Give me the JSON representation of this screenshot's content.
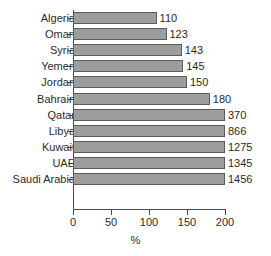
{
  "chart_data": {
    "type": "bar",
    "orientation": "horizontal",
    "title": "",
    "xlabel": "%",
    "ylabel": "",
    "xlim": [
      0,
      200
    ],
    "xticks": [
      "0",
      "50",
      "100",
      "150",
      "200"
    ],
    "grid": false,
    "legend": null,
    "note": "Bars are clipped at the axis maximum of 200; data labels show the true values.",
    "categories": [
      "Algeria",
      "Oman",
      "Syria",
      "Yemen",
      "Jordan",
      "Bahrain",
      "Qatar",
      "Libya",
      "Kuwait",
      "UAE",
      "Saudi Arabia"
    ],
    "values": [
      110,
      123,
      143,
      145,
      150,
      180,
      370,
      866,
      1275,
      1345,
      1456
    ],
    "value_labels": [
      "110",
      "123",
      "143",
      "145",
      "150",
      "180",
      "370",
      "866",
      "1275",
      "1345",
      "1456"
    ],
    "colors": {
      "bar_fill": "#9d9d9d",
      "bar_stroke": "#5c5c5c",
      "axis": "#4a4a4a",
      "text": "#2b2b2b",
      "background": "#ffffff"
    }
  }
}
